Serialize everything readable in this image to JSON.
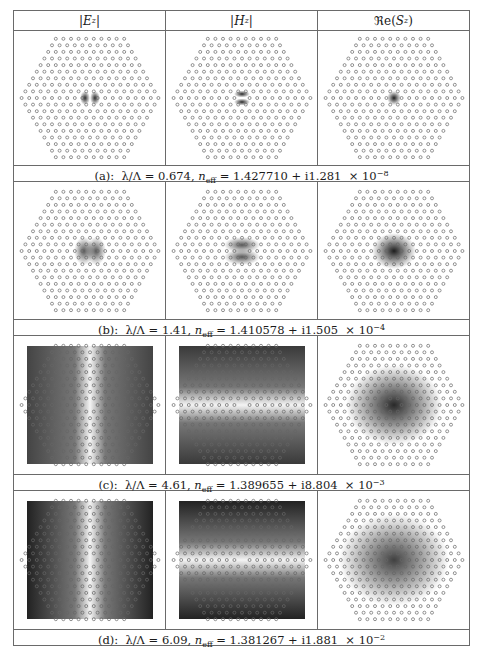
{
  "figure": {
    "columns": [
      "|E_z|",
      "|H_z|",
      "Re(S_z)"
    ],
    "column_display": [
      {
        "pre": "|",
        "sym": "E",
        "sub": "z",
        "post": "|"
      },
      {
        "pre": "|",
        "sym": "H",
        "sub": "z",
        "post": "|"
      },
      {
        "pre": "ℜe(",
        "sym": "S",
        "sub": "z",
        "post": ")"
      }
    ],
    "rows": [
      {
        "label": "(a):",
        "lambda_ratio": "0.674",
        "n_eff_real": "1.427710",
        "n_eff_imag": "1.281",
        "exponent": "−8",
        "panels": [
          "Ez: two dark lobes at defect core",
          "Hz: two horizontal dark bars at core",
          "Re(Sz): single dark spot at core"
        ]
      },
      {
        "label": "(b):",
        "lambda_ratio": "1.41",
        "n_eff_real": "1.410578",
        "n_eff_imag": "1.505",
        "exponent": "−4",
        "panels": [
          "Ez: lobes spreading into first rings",
          "Hz: horizontal bars spreading into rings",
          "Re(Sz): broader dark spot"
        ]
      },
      {
        "label": "(c):",
        "lambda_ratio": "4.61",
        "n_eff_real": "1.389655",
        "n_eff_imag": "8.804",
        "exponent": "−3",
        "panels": [
          "Ez: field fills square domain, bright vertical band",
          "Hz: field fills square domain, bright horizontal band",
          "Re(Sz): large dark blob over hexagonal lattice"
        ]
      },
      {
        "label": "(d):",
        "lambda_ratio": "6.09",
        "n_eff_real": "1.381267",
        "n_eff_imag": "1.881",
        "exponent": "−2",
        "panels": [
          "Ez: dark sides, bright vertical hourglass",
          "Hz: dark top/bottom, bright horizontal band",
          "Re(Sz): broad diffuse blob over lattice"
        ]
      }
    ],
    "caption_template": {
      "lambda_symbol": "λ/Λ = ",
      "n_symbol": "n",
      "n_sub": "eff",
      "plus_i": " + i",
      "times": " × 10"
    }
  }
}
